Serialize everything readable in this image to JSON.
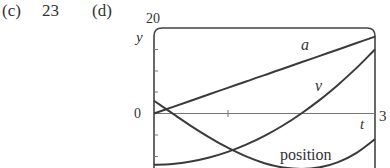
{
  "part_c": {
    "label": "(c)",
    "answer": "23"
  },
  "part_d": {
    "label": "(d)"
  },
  "axes": {
    "y_label": "y",
    "x_label": "t",
    "y_top_tick": "20",
    "y_zero_tick": "0",
    "x_right_tick": "3"
  },
  "curve_labels": {
    "a": "a",
    "v": "v",
    "position": "position"
  },
  "chart_data": {
    "type": "line",
    "title": "",
    "xlabel": "t",
    "ylabel": "y",
    "xlim": [
      0,
      3
    ],
    "ylim": [
      -12,
      20
    ],
    "x_ticks": [
      0,
      1,
      2,
      3
    ],
    "y_ticks": [
      -10,
      -5,
      0,
      5,
      10,
      15,
      20
    ],
    "grid": false,
    "legend": "inline labels",
    "x": [
      0,
      0.25,
      0.5,
      0.75,
      1,
      1.25,
      1.5,
      1.75,
      2,
      2.25,
      2.5,
      2.75,
      3
    ],
    "series": [
      {
        "name": "a",
        "formula": "6t",
        "values": [
          0,
          1.5,
          3,
          4.5,
          6,
          7.5,
          9,
          10.5,
          12,
          13.5,
          15,
          16.5,
          18
        ]
      },
      {
        "name": "v",
        "formula": "3t^2 - 12",
        "values": [
          -12,
          -11.81,
          -11.25,
          -10.31,
          -9,
          -7.31,
          -5.25,
          -2.81,
          0,
          3.19,
          6.75,
          10.69,
          15
        ]
      },
      {
        "name": "position",
        "formula": "t^3 - 12t + 3",
        "values": [
          3,
          0.02,
          -2.88,
          -5.58,
          -8,
          -10.05,
          -11.63,
          -12.64,
          -13,
          -12.61,
          -11.38,
          -9.2,
          -6
        ]
      }
    ]
  }
}
